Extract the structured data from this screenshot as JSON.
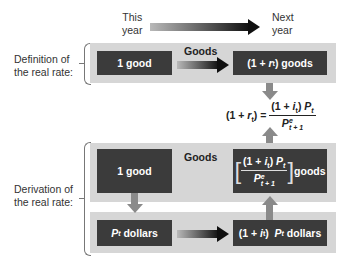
{
  "timeline": {
    "start_label_line1": "This",
    "start_label_line2": "year",
    "end_label_line1": "Next",
    "end_label_line2": "year"
  },
  "definition": {
    "side_label_line1": "Definition of",
    "side_label_line2": "the real rate:",
    "left_box": "1 good",
    "arrow_label": "Goods",
    "right_box_prefix": "(1 + ",
    "right_box_var": "r",
    "right_box_sub": "t",
    "right_box_suffix": ") goods"
  },
  "formula": {
    "lhs_prefix": "(1 + ",
    "lhs_var": "r",
    "lhs_sub": "t",
    "lhs_suffix": ") =",
    "num_prefix": "(1 + ",
    "num_var": "i",
    "num_sub": "t",
    "num_suffix": ") ",
    "num_price": "P",
    "num_price_sub": "t",
    "den_price": "P",
    "den_sup": "e",
    "den_sub": "t + 1"
  },
  "derivation": {
    "side_label_line1": "Derivation of",
    "side_label_line2": "the real rate:",
    "top_left_box": "1 good",
    "goods_label": "Goods",
    "top_right_box_suffix": "goods",
    "bottom_left_price": "P",
    "bottom_left_sub": "t",
    "bottom_left_suffix": " dollars",
    "bottom_right_prefix": "(1 + ",
    "bottom_right_var": "i",
    "bottom_right_sub": "t",
    "bottom_right_mid": ")  ",
    "bottom_right_price": "P",
    "bottom_right_price_sub": "t",
    "bottom_right_suffix": " dollars"
  },
  "colors": {
    "panel": "#d6d6d6",
    "dark_box": "#3b3b3b",
    "arrow_dark": "#101010",
    "arrow_gray": "#8a8a8a"
  }
}
